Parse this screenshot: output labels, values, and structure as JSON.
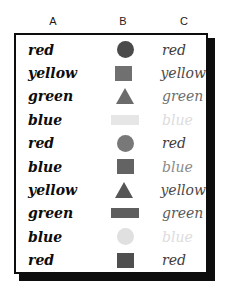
{
  "figure": {
    "columns": [
      {
        "key": "A",
        "label": "A"
      },
      {
        "key": "B",
        "label": "B"
      },
      {
        "key": "C",
        "label": "C"
      }
    ]
  },
  "rows": [
    {
      "a_word": "red",
      "a_color": "#0d0d0d",
      "b_shape": "circle",
      "b_color": "#4a4a4a",
      "c_word": "red",
      "c_color": "#3d3d3d"
    },
    {
      "a_word": "yellow",
      "a_color": "#0d0d0d",
      "b_shape": "square",
      "b_color": "#707070",
      "c_word": "yellow",
      "c_color": "#4a4a4a"
    },
    {
      "a_word": "green",
      "a_color": "#0d0d0d",
      "b_shape": "triangle",
      "b_color": "#6b6b6b",
      "c_word": "green",
      "c_color": "#6e6e6e"
    },
    {
      "a_word": "blue",
      "a_color": "#0d0d0d",
      "b_shape": "rect",
      "b_color": "#e6e6e6",
      "c_word": "blue",
      "c_color": "#dcdcdc"
    },
    {
      "a_word": "red",
      "a_color": "#0d0d0d",
      "b_shape": "circle",
      "b_color": "#787878",
      "c_word": "red",
      "c_color": "#3d3d3d"
    },
    {
      "a_word": "blue",
      "a_color": "#0d0d0d",
      "b_shape": "square",
      "b_color": "#636363",
      "c_word": "blue",
      "c_color": "#8a8a8a"
    },
    {
      "a_word": "yellow",
      "a_color": "#0d0d0d",
      "b_shape": "triangle",
      "b_color": "#565656",
      "c_word": "yellow",
      "c_color": "#4a4a4a"
    },
    {
      "a_word": "green",
      "a_color": "#0d0d0d",
      "b_shape": "rect",
      "b_color": "#5e5e5e",
      "c_word": "green",
      "c_color": "#5a5a5a"
    },
    {
      "a_word": "blue",
      "a_color": "#0d0d0d",
      "b_shape": "circle",
      "b_color": "#e0e0e0",
      "c_word": "blue",
      "c_color": "#dcdcdc"
    },
    {
      "a_word": "red",
      "a_color": "#0d0d0d",
      "b_shape": "square",
      "b_color": "#4f4f4f",
      "c_word": "red",
      "c_color": "#3d3d3d"
    }
  ]
}
